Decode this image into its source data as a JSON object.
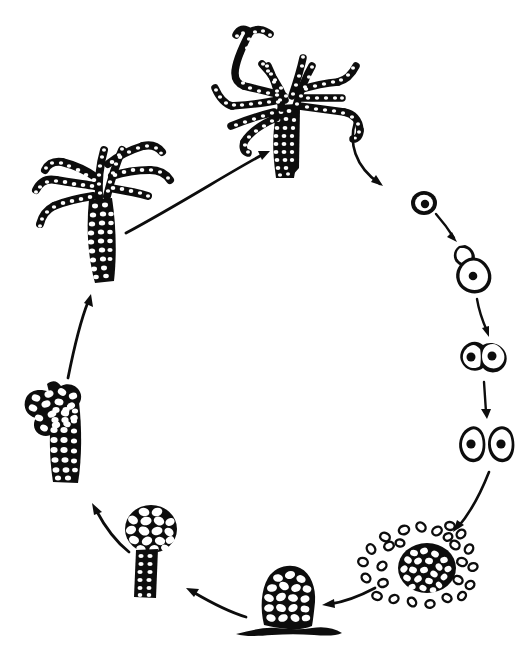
{
  "figure": {
    "title": "Life cycle of a cellular slime mould",
    "subject": "Dictyostelium-type cellular slime mould life cycle",
    "background_color": "#ffffff",
    "ink_color": "#0d0d0d",
    "style": "black-and-white line drawing, stippled / cell-textured silhouettes",
    "cycle_direction": "clockwise",
    "stage_count": 8,
    "arrow_count": 8,
    "visible_text": ""
  },
  "stages": [
    {
      "id": "mature-sporangium",
      "label": "Mature branched sporangium with spore chains",
      "position": "top-center",
      "description": "Tall stalk topped by repeatedly branching arms made of chains of beaded spores",
      "cx": 290,
      "cy": 85
    },
    {
      "id": "single-spore",
      "label": "Single spore with nucleus",
      "position": "right-upper",
      "description": "Small oval spore containing one dark round nucleus",
      "cx": 424,
      "cy": 203
    },
    {
      "id": "germinating-amoeba",
      "label": "Germinating spore releasing myxamoeba",
      "position": "right",
      "description": "Spore case split open with an emerging amoeba bearing a nucleus",
      "cx": 471,
      "cy": 258
    },
    {
      "id": "dividing-amoeba",
      "label": "Amoeba undergoing binary fission",
      "position": "right-lower",
      "description": "Two nucleated lobes still joined, mid-division",
      "cx": 483,
      "cy": 353
    },
    {
      "id": "two-amoebae",
      "label": "Two daughter myxamoebae",
      "position": "right-lower-2",
      "description": "Two separate nucleated amoebae after division",
      "cx": 487,
      "cy": 443
    },
    {
      "id": "aggregation",
      "label": "Aggregating amoebae forming a mound",
      "position": "bottom-right",
      "description": "Dense central clump of cells with scattered amoebae streaming inward",
      "cx": 427,
      "cy": 567
    },
    {
      "id": "pseudoplasmodium",
      "label": "Pseudoplasmodium (grex / mound)",
      "position": "bottom-center",
      "description": "Rounded multicellular mound of packed cells sitting on the substrate",
      "cx": 288,
      "cy": 593
    },
    {
      "id": "young-sporangium",
      "label": "Young sporangium on a stalk",
      "position": "bottom-left",
      "description": "Short dark stalk supporting a rounded head of large cells",
      "cx": 150,
      "cy": 545
    },
    {
      "id": "branching-sporangium",
      "label": "Elongating, early-branching sporangium",
      "position": "left",
      "description": "Thick cell-filled column beginning to form short lateral branches",
      "cx": 62,
      "cy": 430
    },
    {
      "id": "developing-sporangium",
      "label": "Developing branched sporangium",
      "position": "left-upper",
      "description": "Stalk with several elongated branches forming beaded spore chains",
      "cx": 105,
      "cy": 215
    }
  ],
  "arrows": [
    {
      "id": "arrow-sporangium-to-spore",
      "from": "mature-sporangium",
      "to": "single-spore",
      "label": "spore release"
    },
    {
      "id": "arrow-spore-to-germinating",
      "from": "single-spore",
      "to": "germinating-amoeba",
      "label": "germination"
    },
    {
      "id": "arrow-germinating-to-dividing",
      "from": "germinating-amoeba",
      "to": "dividing-amoeba",
      "label": "growth"
    },
    {
      "id": "arrow-dividing-to-two",
      "from": "dividing-amoeba",
      "to": "two-amoebae",
      "label": "binary fission"
    },
    {
      "id": "arrow-two-to-aggregation",
      "from": "two-amoebae",
      "to": "aggregation",
      "label": "aggregation"
    },
    {
      "id": "arrow-aggregation-to-mound",
      "from": "aggregation",
      "to": "pseudoplasmodium",
      "label": "mound formation"
    },
    {
      "id": "arrow-mound-to-young",
      "from": "pseudoplasmodium",
      "to": "young-sporangium",
      "label": "culmination"
    },
    {
      "id": "arrow-young-to-branching",
      "from": "young-sporangium",
      "to": "branching-sporangium",
      "label": "elongation"
    },
    {
      "id": "arrow-branching-to-developing",
      "from": "branching-sporangium",
      "to": "developing-sporangium",
      "label": "branching"
    },
    {
      "id": "arrow-developing-to-mature",
      "from": "developing-sporangium",
      "to": "mature-sporangium",
      "label": "maturation"
    }
  ]
}
